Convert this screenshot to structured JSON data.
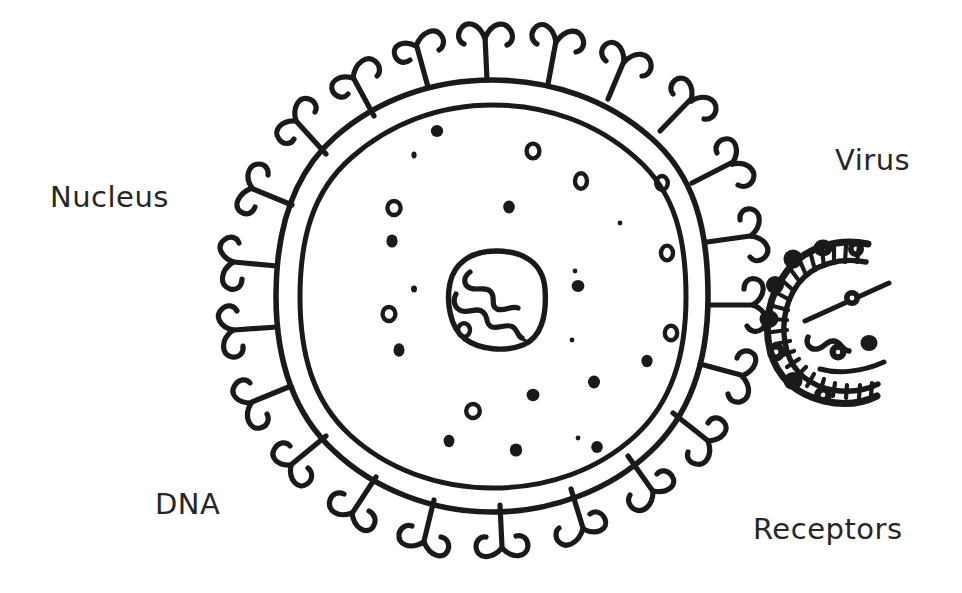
{
  "diagram": {
    "background_color": "#ffffff",
    "ink_color": "#1a1a1a",
    "labels": {
      "nucleus": "Nucleus",
      "virus": "Virus",
      "dna": "DNA",
      "receptors": "Receptors"
    },
    "cell": {
      "center_x": 492,
      "center_y": 296,
      "outer_membrane_radius": 216,
      "inner_membrane_radius": 192,
      "receptor_count": 22,
      "receptor_shape": "y-shaped-fork"
    },
    "nucleus": {
      "center_x": 496,
      "center_y": 299,
      "radius": 48,
      "contains": "squiggly-dna-strand"
    },
    "organelles": {
      "solid_dot_count": 12,
      "hollow_ring_count": 9,
      "solid_dots": [
        [
          437,
          131
        ],
        [
          509,
          207
        ],
        [
          392,
          241
        ],
        [
          578,
          286
        ],
        [
          399,
          350
        ],
        [
          593,
          382
        ],
        [
          532,
          394
        ],
        [
          597,
          447
        ],
        [
          413,
          154
        ],
        [
          516,
          449
        ],
        [
          578,
          283
        ],
        [
          448,
          440
        ]
      ],
      "hollow_rings": [
        [
          533,
          151
        ],
        [
          581,
          181
        ],
        [
          394,
          209
        ],
        [
          668,
          253
        ],
        [
          474,
          410
        ],
        [
          672,
          333
        ],
        [
          478,
          332
        ],
        [
          662,
          183
        ],
        [
          389,
          314
        ]
      ]
    },
    "virus": {
      "center_x": 822,
      "center_y": 320,
      "radius": 62,
      "capsid_shape": "crescent-open-left",
      "knob_count": 8,
      "spike_tick_count": 22,
      "contains": "squiggly-genome-with-particles"
    }
  }
}
